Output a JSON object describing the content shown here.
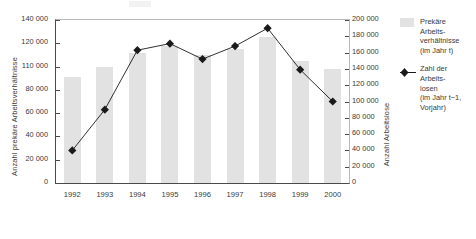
{
  "chart_data": {
    "type": "bar",
    "title": "",
    "subtitle": "",
    "categories": [
      "1992",
      "1993",
      "1994",
      "1995",
      "1996",
      "1997",
      "1998",
      "1999",
      "2000"
    ],
    "xlabel": "",
    "grid": false,
    "legend_position": "right",
    "series": [
      {
        "name": "Prekäre Arbeitsverhältnisse (im Jahr t)",
        "type": "bar",
        "axis": "left",
        "color": "#e2e2e2",
        "values": [
          91000,
          100000,
          112000,
          118000,
          110000,
          115000,
          125000,
          105000,
          98000
        ]
      },
      {
        "name": "Zahl der Arbeitslosen (im Jahr t-1, Vorjahr)",
        "type": "line",
        "axis": "right",
        "color": "#1a1a1a",
        "marker": "diamond",
        "values": [
          40000,
          90000,
          163000,
          171000,
          152000,
          168000,
          190000,
          139000,
          100000
        ]
      }
    ],
    "yaxis_left": {
      "label": "Anzahl prekäre Arbeitsverhältnisse",
      "min": 0,
      "max": 140000,
      "tick_values": [
        140000,
        120000,
        100000,
        80000,
        60000,
        40000,
        20000,
        0
      ],
      "tick_labels": [
        "140 000",
        "120 000",
        "110 000",
        "80 000",
        "60 000",
        "40 000",
        "20 000",
        "0"
      ]
    },
    "yaxis_right": {
      "label": "Anzahl Arbeitslose",
      "min": 0,
      "max": 200000,
      "tick_values": [
        200000,
        180000,
        160000,
        140000,
        120000,
        100000,
        80000,
        60000,
        40000,
        20000,
        0
      ],
      "tick_labels": [
        "200 000",
        "180 000",
        "160 000",
        "140 000",
        "120 000",
        "100 000",
        "80 000",
        "60 000",
        "40 000",
        "20 000",
        "0"
      ]
    }
  },
  "legend": {
    "items": [
      {
        "swatch": "bar-swatch",
        "label": "Prekäre\nArbeits-\nverhältnisse\n(im Jahr t)"
      },
      {
        "swatch": "line-marker-swatch",
        "label": "Zahl der\nArbeits-\nlosen\n(im Jahr t−1,\nVorjahr)"
      }
    ]
  },
  "colors": {
    "bar_fill": "#e2e2e2",
    "line_stroke": "#1a1a1a",
    "axis": "#4a4a4a",
    "text": "#3a3a3a",
    "background": "#ffffff"
  }
}
